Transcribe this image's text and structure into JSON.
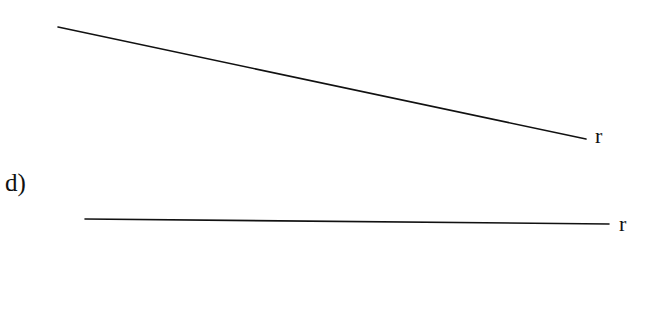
{
  "part_label": "d)",
  "lines": [
    {
      "name": "upper-line",
      "x1": 58,
      "y1": 27,
      "x2": 586,
      "y2": 139,
      "label": "r"
    },
    {
      "name": "lower-line",
      "x1": 85,
      "y1": 219,
      "x2": 609,
      "y2": 224,
      "label": "r"
    }
  ],
  "stroke_color": "#111111"
}
